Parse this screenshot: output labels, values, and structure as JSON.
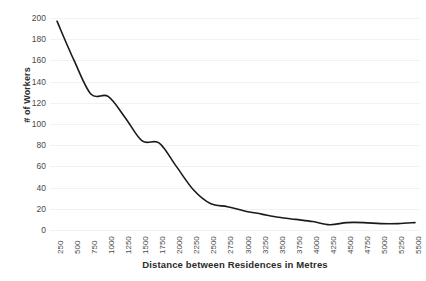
{
  "chart_data": {
    "type": "line",
    "title": "",
    "subtitle": "",
    "xlabel": "Distance between Residences in Metres",
    "ylabel": "# of Workers",
    "xlim": [
      250,
      5500
    ],
    "ylim": [
      0,
      200
    ],
    "y_tick_step": 20,
    "x_tick_step": 250,
    "grid": "horizontal",
    "legend": "none",
    "line_color": "#1a1a1a",
    "line_width": 1.6,
    "smoothing": "spline",
    "markers": "none",
    "categories": [
      "250",
      "500",
      "750",
      "1000",
      "1250",
      "1500",
      "1750",
      "2000",
      "2250",
      "2500",
      "2750",
      "3000",
      "3250",
      "3500",
      "3750",
      "4000",
      "4250",
      "4500",
      "4750",
      "5000",
      "5250",
      "5500"
    ],
    "x": [
      250,
      500,
      750,
      1000,
      1250,
      1500,
      1750,
      2000,
      2250,
      2500,
      2750,
      3000,
      3250,
      3500,
      3750,
      4000,
      4250,
      4500,
      4750,
      5000,
      5250,
      5500
    ],
    "values": [
      197,
      160,
      128,
      126,
      106,
      84,
      82,
      60,
      38,
      25,
      22,
      18,
      15,
      12,
      10,
      8,
      5,
      7,
      7,
      6,
      6,
      7
    ],
    "y_tick_labels": [
      "200",
      "180",
      "160",
      "140",
      "120",
      "100",
      "80",
      "60",
      "40",
      "20",
      "0"
    ],
    "y_tick_values": [
      200,
      180,
      160,
      140,
      120,
      100,
      80,
      60,
      40,
      20,
      0
    ]
  },
  "colors": {
    "line": "#1a1a1a",
    "gridline": "#f2f2f2",
    "tick_text": "#4a4a4a",
    "title_text": "#2b2b2b",
    "background": "#ffffff"
  }
}
